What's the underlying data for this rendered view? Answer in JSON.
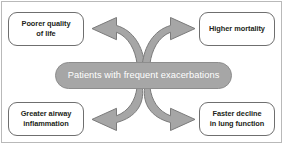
{
  "diagram": {
    "center": {
      "label": "Patients with frequent exacerbations",
      "fill_color": "#a6a6a6",
      "text_color": "#ffffff",
      "stroke_color": "#8d8d8d"
    },
    "frame": {
      "border_color": "#b9b9b9",
      "background_color": "#ffffff"
    },
    "arrow_style": {
      "fill_color": "#a6a6a6",
      "stroke_color": "#7b7b7b"
    },
    "nodes": [
      {
        "id": "poorer-quality-of-life",
        "position": "top-left",
        "label": "Poorer quality of life",
        "line1": "Poorer quality",
        "line2": "of life",
        "border_color": "#6f6f6f",
        "text_color": "#231f20"
      },
      {
        "id": "higher-mortality",
        "position": "top-right",
        "label": "Higher mortality",
        "line1": "Higher mortality",
        "line2": "",
        "border_color": "#6f6f6f",
        "text_color": "#231f20"
      },
      {
        "id": "greater-airway-inflammation",
        "position": "bottom-left",
        "label": "Greater airway inflammation",
        "line1": "Greater airway",
        "line2": "inflammation",
        "border_color": "#6f6f6f",
        "text_color": "#231f20"
      },
      {
        "id": "faster-decline-in-lung-function",
        "position": "bottom-right",
        "label": "Faster decline in lung function",
        "line1": "Faster decline",
        "line2": "in lung function",
        "border_color": "#6f6f6f",
        "text_color": "#231f20"
      }
    ],
    "arrows": [
      {
        "id": "arrow-to-poorer-quality-of-life",
        "from": "center",
        "to": "poorer-quality-of-life",
        "direction": "upper-left"
      },
      {
        "id": "arrow-to-higher-mortality",
        "from": "center",
        "to": "higher-mortality",
        "direction": "upper-right"
      },
      {
        "id": "arrow-to-greater-airway-inflammation",
        "from": "center",
        "to": "greater-airway-inflammation",
        "direction": "lower-left"
      },
      {
        "id": "arrow-to-faster-decline-in-lung-function",
        "from": "center",
        "to": "faster-decline-in-lung-function",
        "direction": "lower-right"
      }
    ]
  }
}
